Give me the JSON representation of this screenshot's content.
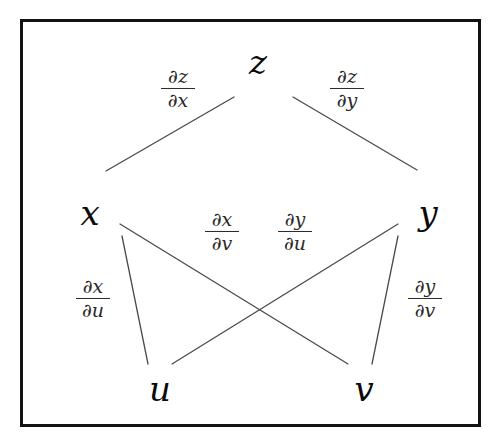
{
  "figure": {
    "kind": "chain-rule-dependency-tree",
    "background_color": "#ffffff",
    "border_color": "#111111",
    "line_color": "#4a4a4a",
    "text_color": "#0b0b0b"
  },
  "nodes": [
    {
      "id": "z",
      "label": "z",
      "x": 258,
      "y": 62
    },
    {
      "id": "x",
      "label": "x",
      "x": 90,
      "y": 213
    },
    {
      "id": "y",
      "label": "y",
      "x": 428,
      "y": 213
    },
    {
      "id": "u",
      "label": "u",
      "x": 160,
      "y": 389
    },
    {
      "id": "v",
      "label": "v",
      "x": 364,
      "y": 389
    }
  ],
  "edges": [
    {
      "id": "z-x",
      "from": "z",
      "to": "x",
      "x1": 234,
      "y1": 97,
      "x2": 106,
      "y2": 171
    },
    {
      "id": "z-y",
      "from": "z",
      "to": "y",
      "x1": 293,
      "y1": 97,
      "x2": 417,
      "y2": 170
    },
    {
      "id": "x-u",
      "from": "x",
      "to": "u",
      "x1": 122,
      "y1": 236,
      "x2": 148,
      "y2": 364
    },
    {
      "id": "x-v",
      "from": "x",
      "to": "v",
      "x1": 120,
      "y1": 224,
      "x2": 348,
      "y2": 364
    },
    {
      "id": "y-u",
      "from": "y",
      "to": "u",
      "x1": 398,
      "y1": 224,
      "x2": 172,
      "y2": 364
    },
    {
      "id": "y-v",
      "from": "y",
      "to": "v",
      "x1": 398,
      "y1": 236,
      "x2": 372,
      "y2": 364
    }
  ],
  "edge_labels": [
    {
      "id": "dz-dx",
      "edge": "z-x",
      "numerator": "∂z",
      "denominator": "∂x",
      "x": 178,
      "y": 88
    },
    {
      "id": "dz-dy",
      "edge": "z-y",
      "numerator": "∂z",
      "denominator": "∂y",
      "x": 347,
      "y": 88
    },
    {
      "id": "dx-dv",
      "edge": "x-v",
      "numerator": "∂x",
      "denominator": "∂v",
      "x": 222,
      "y": 231
    },
    {
      "id": "dy-du",
      "edge": "y-u",
      "numerator": "∂y",
      "denominator": "∂u",
      "x": 295,
      "y": 231
    },
    {
      "id": "dx-du",
      "edge": "x-u",
      "numerator": "∂x",
      "denominator": "∂u",
      "x": 93,
      "y": 298
    },
    {
      "id": "dy-dv",
      "edge": "y-v",
      "numerator": "∂y",
      "denominator": "∂v",
      "x": 425,
      "y": 298
    }
  ],
  "chart_data": {
    "type": "diagram",
    "title": "",
    "levels": [
      {
        "level": 0,
        "nodes": [
          "z"
        ]
      },
      {
        "level": 1,
        "nodes": [
          "x",
          "y"
        ]
      },
      {
        "level": 2,
        "nodes": [
          "u",
          "v"
        ]
      }
    ],
    "connections": [
      {
        "from": "z",
        "to": "x",
        "label": "∂z/∂x"
      },
      {
        "from": "z",
        "to": "y",
        "label": "∂z/∂y"
      },
      {
        "from": "x",
        "to": "u",
        "label": "∂x/∂u"
      },
      {
        "from": "x",
        "to": "v",
        "label": "∂x/∂v"
      },
      {
        "from": "y",
        "to": "u",
        "label": "∂y/∂u"
      },
      {
        "from": "y",
        "to": "v",
        "label": "∂y/∂v"
      }
    ]
  }
}
